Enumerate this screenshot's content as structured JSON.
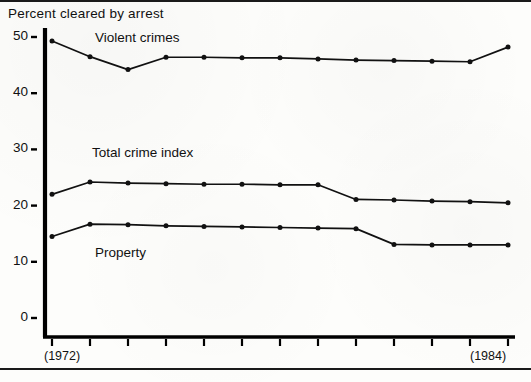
{
  "chart_data": {
    "type": "line",
    "title": "Percent cleared by arrest",
    "xlabel": "",
    "ylabel": "",
    "ylim": [
      0,
      52
    ],
    "yticks": [
      0,
      10,
      20,
      30,
      40,
      50
    ],
    "ytick_labels": [
      "0",
      "10",
      "20",
      "30",
      "40",
      "50"
    ],
    "grid": false,
    "legend_position": "inline-annotations",
    "x": [
      1972,
      1973,
      1974,
      1975,
      1976,
      1977,
      1978,
      1979,
      1980,
      1981,
      1982,
      1983,
      1984
    ],
    "xtick_labels": [
      "",
      "",
      "",
      "",
      "",
      "",
      "",
      "",
      "",
      "",
      "",
      "",
      ""
    ],
    "x_axis_endpoint_labels": {
      "left": "(1972)",
      "right": "(1984)"
    },
    "series": [
      {
        "name": "Violent crimes",
        "label": "Violent crimes",
        "values": [
          49.3,
          46.5,
          44.2,
          46.4,
          46.4,
          46.3,
          46.3,
          46.1,
          45.9,
          45.8,
          45.7,
          45.6,
          48.2
        ]
      },
      {
        "name": "Total crime index",
        "label": "Total crime index",
        "values": [
          22.0,
          24.2,
          24.0,
          23.9,
          23.8,
          23.8,
          23.7,
          23.7,
          21.1,
          21.0,
          20.8,
          20.7,
          20.5
        ]
      },
      {
        "name": "Property",
        "label": "Property",
        "values": [
          14.5,
          16.7,
          16.6,
          16.4,
          16.3,
          16.2,
          16.1,
          16.0,
          15.9,
          13.1,
          13.0,
          13.0,
          13.0
        ]
      }
    ],
    "annotations": [
      {
        "text": "Violent crimes",
        "x_index": 2,
        "y_value": 50.5
      },
      {
        "text": "Total crime index",
        "x_index": 2,
        "y_value": 30.0
      },
      {
        "text": "Property",
        "x_index": 2,
        "y_value": 11.5
      }
    ]
  },
  "colors": {
    "ink": "#111111",
    "axis": "#000000",
    "paper": "#fdfdfb"
  }
}
